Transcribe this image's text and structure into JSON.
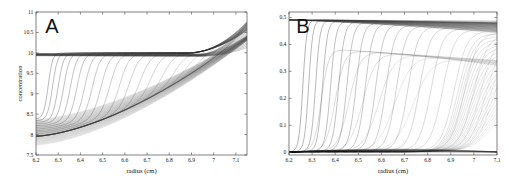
{
  "figure": {
    "background_color": "#ffffff",
    "curve_color": "#2b2b2b",
    "axis_color": "#4a4a4a"
  },
  "chart_data": [
    {
      "panel_label": "A",
      "type": "line",
      "title": "",
      "xlabel": "radius (cm)",
      "ylabel": "concentration",
      "xlim": [
        6.2,
        7.15
      ],
      "ylim": [
        7.5,
        11.0
      ],
      "xticks": [
        6.2,
        6.3,
        6.4,
        6.5,
        6.6,
        6.7,
        6.8,
        6.9,
        7.0,
        7.1
      ],
      "xticklabels": [
        "6.2",
        "6.3",
        "6.4",
        "6.5",
        "6.6",
        "6.7",
        "6.8",
        "6.9",
        "7",
        "7.1"
      ],
      "yticks": [
        7.5,
        8.0,
        8.5,
        9.0,
        9.5,
        10.0,
        10.5,
        11.0
      ],
      "yticklabels": [
        "7.5",
        "8",
        "8.5",
        "9",
        "9.5",
        "10",
        "10.5",
        "11"
      ],
      "grid": false,
      "legend": "none",
      "n_curves": 26,
      "description": "Family of sedimentation concentration profiles; sigmoidal boundaries sweep rightwards with time, plateau near 10, lower baseline bundle rises from 7.75 to 10.3 toward the cell bottom.",
      "series": [
        {
          "name": "upper boundary family",
          "plateau": 10.0,
          "meniscus_start": 8.35,
          "boundary_positions": [
            6.255,
            6.275,
            6.3,
            6.325,
            6.355,
            6.385,
            6.42,
            6.455,
            6.495,
            6.535,
            6.58,
            6.625,
            6.675,
            6.725,
            6.78,
            6.835,
            6.89,
            6.945,
            7.0,
            7.04,
            7.07,
            7.09,
            7.105,
            7.115,
            7.125,
            7.13
          ]
        },
        {
          "name": "lower depleted bundle",
          "start_value": 7.75,
          "end_value": 10.35,
          "description": "Plateau-depletion curves sweeping from meniscus to base"
        }
      ]
    },
    {
      "panel_label": "B",
      "type": "line",
      "title": "",
      "xlabel": "radius (cm)",
      "ylabel": "",
      "xlim": [
        6.2,
        7.1
      ],
      "ylim": [
        -0.01,
        0.52
      ],
      "xticks": [
        6.2,
        6.3,
        6.4,
        6.5,
        6.6,
        6.7,
        6.8,
        6.9,
        7.0,
        7.1
      ],
      "xticklabels": [
        "6.2",
        "6.3",
        "6.4",
        "6.5",
        "6.6",
        "6.7",
        "6.8",
        "6.9",
        "7",
        "7.1"
      ],
      "yticks": [
        0,
        0.1,
        0.2,
        0.3,
        0.4,
        0.5
      ],
      "yticklabels": [
        "0",
        "0.1",
        "0.2",
        "0.3",
        "0.4",
        "0.5"
      ],
      "grid": false,
      "legend": "none",
      "n_curves": 30,
      "description": "Family of steep sigmoidal boundary curves rising from zero baseline to plateaus between 0.44 and 0.49; a secondary slower family plateaus near 0.33-0.38; latest curves only rise near the cell base.",
      "series": [
        {
          "name": "fast boundary family",
          "plateau_high": 0.492,
          "plateau_low": 0.44,
          "baseline": 0.0,
          "boundary_positions": [
            6.26,
            6.285,
            6.315,
            6.345,
            6.38,
            6.415,
            6.45,
            6.49,
            6.53,
            6.575,
            6.62,
            6.665,
            6.715,
            6.765,
            6.815,
            6.865,
            6.915,
            6.96,
            7.0,
            7.03,
            7.055,
            7.075,
            7.09
          ]
        },
        {
          "name": "slow secondary family",
          "plateau_high": 0.385,
          "plateau_low": 0.332,
          "baseline": 0.0,
          "boundary_positions": [
            6.34,
            6.4,
            6.46,
            6.52,
            6.59,
            6.66,
            6.74
          ]
        }
      ]
    }
  ]
}
